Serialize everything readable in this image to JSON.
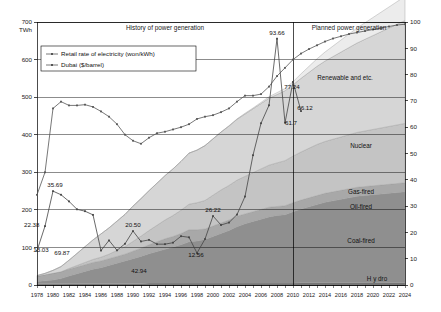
{
  "chart_data": {
    "type": "area",
    "title": "",
    "xlabel": "",
    "ylabel": "TWh",
    "y_unit_left": "TWh",
    "ylim": [
      0,
      700
    ],
    "ylim_right": [
      0,
      100
    ],
    "grid": true,
    "legend_position": "top-left",
    "x": [
      1978,
      1979,
      1980,
      1981,
      1982,
      1983,
      1984,
      1985,
      1986,
      1987,
      1988,
      1989,
      1990,
      1991,
      1992,
      1993,
      1994,
      1995,
      1996,
      1997,
      1998,
      1999,
      2000,
      2001,
      2002,
      2003,
      2004,
      2005,
      2006,
      2007,
      2008,
      2009,
      2010,
      2011,
      2012,
      2013,
      2014,
      2015,
      2016,
      2017,
      2018,
      2019,
      2020,
      2021,
      2022,
      2023,
      2024
    ],
    "x_tick_labels": [
      "1978",
      "1980",
      "1982",
      "1984",
      "1986",
      "1988",
      "1990",
      "1992",
      "1994",
      "1996",
      "1998",
      "2000",
      "2002",
      "2004",
      "2006",
      "2008",
      "2010",
      "2012",
      "2014",
      "2016",
      "2018",
      "2020",
      "2022",
      "2024"
    ],
    "y_tick_labels": [
      "0",
      "100",
      "200",
      "300",
      "400",
      "500",
      "600",
      "700"
    ],
    "y_tick_labels_right": [
      "0",
      "10",
      "20",
      "30",
      "40",
      "50",
      "60",
      "70",
      "80",
      "90",
      "100"
    ],
    "section_labels": [
      {
        "text": "History of power generation",
        "x": 1994
      },
      {
        "text": "Planned power generation",
        "x": 2017
      }
    ],
    "divider_year": 2010,
    "stacked_series": [
      {
        "name": "Hydro",
        "label": "H y dro",
        "color": "#6e6e6e",
        "values": [
          3,
          3,
          3,
          3,
          4,
          4,
          4,
          4,
          4,
          4,
          4,
          4,
          4,
          4,
          5,
          5,
          5,
          5,
          5,
          5,
          5,
          5,
          5,
          5,
          5,
          5,
          5,
          5,
          5,
          5,
          5,
          5,
          5,
          6,
          6,
          6,
          6,
          6,
          6,
          6,
          6,
          6,
          6,
          6,
          6,
          6,
          6
        ]
      },
      {
        "name": "Coal-fired",
        "label": "Coal-fired",
        "color": "#8f8f8f",
        "values": [
          6,
          8,
          10,
          14,
          20,
          26,
          32,
          38,
          42,
          48,
          54,
          60,
          66,
          72,
          78,
          84,
          90,
          96,
          102,
          110,
          112,
          116,
          124,
          132,
          140,
          150,
          158,
          164,
          170,
          176,
          180,
          182,
          190,
          196,
          202,
          208,
          214,
          218,
          222,
          226,
          230,
          232,
          234,
          236,
          238,
          240,
          242
        ]
      },
      {
        "name": "Oil-fired",
        "label": "Oil-fired",
        "color": "#a8a8a8",
        "values": [
          14,
          16,
          18,
          18,
          18,
          18,
          18,
          18,
          18,
          18,
          18,
          18,
          20,
          22,
          24,
          26,
          28,
          28,
          30,
          32,
          30,
          28,
          28,
          28,
          28,
          28,
          26,
          26,
          26,
          26,
          24,
          24,
          24,
          24,
          24,
          24,
          24,
          24,
          24,
          24,
          24,
          24,
          24,
          24,
          24,
          24,
          24
        ]
      },
      {
        "name": "Gas-fired",
        "label": "Gas-fired",
        "color": "#c4c4c4",
        "values": [
          0,
          0,
          0,
          0,
          2,
          4,
          6,
          8,
          10,
          12,
          16,
          20,
          26,
          32,
          38,
          44,
          50,
          56,
          62,
          68,
          72,
          76,
          82,
          88,
          92,
          96,
          100,
          104,
          108,
          112,
          116,
          120,
          124,
          128,
          132,
          136,
          138,
          140,
          142,
          144,
          146,
          148,
          150,
          152,
          154,
          156,
          158
        ]
      },
      {
        "name": "Nuclear",
        "label": "Nuclear",
        "color": "#d6d6d6",
        "values": [
          2,
          4,
          8,
          14,
          22,
          32,
          42,
          52,
          62,
          70,
          78,
          86,
          94,
          100,
          106,
          112,
          118,
          124,
          130,
          136,
          140,
          146,
          150,
          154,
          158,
          162,
          166,
          170,
          174,
          178,
          182,
          186,
          190,
          196,
          202,
          208,
          214,
          220,
          226,
          232,
          238,
          244,
          250,
          256,
          262,
          268,
          274
        ]
      },
      {
        "name": "Renewable and etc.",
        "label": "Renewable and etc.",
        "color": "#ececec",
        "values": [
          0,
          0,
          0,
          0,
          0,
          0,
          0,
          0,
          0,
          0,
          0,
          0,
          0,
          0,
          0,
          0,
          0,
          0,
          0,
          0,
          0,
          0,
          0,
          0,
          1,
          1,
          2,
          2,
          3,
          4,
          5,
          6,
          8,
          12,
          16,
          20,
          24,
          28,
          32,
          36,
          40,
          44,
          48,
          52,
          56,
          60,
          64
        ]
      }
    ],
    "line_series": [
      {
        "name": "Retail rate of electricity (won/kWh)",
        "axis": "left",
        "color": "#555555",
        "values": [
          240,
          300,
          470,
          488,
          478,
          478,
          480,
          474,
          462,
          448,
          428,
          400,
          384,
          376,
          392,
          404,
          408,
          414,
          420,
          428,
          442,
          448,
          452,
          460,
          470,
          488,
          504,
          504,
          508,
          528,
          556,
          578,
          600,
          616,
          628,
          638,
          648,
          656,
          662,
          668,
          672,
          676,
          680,
          684,
          688,
          692,
          694
        ]
      },
      {
        "name": "Dubai ($/barrel)",
        "axis": "right",
        "color": "#444444",
        "values": [
          13.03,
          22.38,
          35.69,
          34.32,
          31.8,
          28.78,
          28.06,
          26.67,
          13.1,
          16.95,
          13.18,
          15.68,
          20.5,
          16.56,
          17.16,
          15.52,
          15.53,
          16.1,
          18.56,
          18.13,
          12.16,
          17.47,
          26.22,
          22.81,
          23.74,
          26.78,
          33.64,
          49.35,
          61.5,
          68.34,
          93.66,
          61.7,
          77.24,
          66.12,
          null,
          null,
          null,
          null,
          null,
          null,
          null,
          null,
          null,
          null,
          null,
          null,
          null
        ]
      }
    ],
    "data_labels": [
      {
        "text": "22.38",
        "series": "Dubai ($/barrel)",
        "year": 1979,
        "value": 22.38
      },
      {
        "text": "13.03",
        "series": "Dubai ($/barrel)",
        "year": 1978,
        "value": 13.03
      },
      {
        "text": "35.69",
        "series": "Dubai ($/barrel)",
        "year": 1980,
        "value": 35.69
      },
      {
        "text": "20.50",
        "series": "Dubai ($/barrel)",
        "year": 1990,
        "value": 20.5
      },
      {
        "text": "12.56",
        "series": "Dubai ($/barrel)",
        "year": 1998,
        "value": 12.56
      },
      {
        "text": "26.22",
        "series": "Dubai ($/barrel)",
        "year": 2000,
        "value": 26.22
      },
      {
        "text": "93.66",
        "series": "Dubai ($/barrel)",
        "year": 2008,
        "value": 93.66
      },
      {
        "text": "61.7",
        "series": "Dubai ($/barrel)",
        "year": 2009,
        "value": 61.7
      },
      {
        "text": "77.24",
        "series": "Dubai ($/barrel)",
        "year": 2010,
        "value": 77.24
      },
      {
        "text": "66.12",
        "series": "Dubai ($/barrel)",
        "year": 2011,
        "value": 66.12
      },
      {
        "text": "69.87",
        "series": "Retail rate of electricity (won/kWh)",
        "year": 1981,
        "value": 69.87
      },
      {
        "text": "42.94",
        "series": "Retail rate of electricity (won/kWh)",
        "year": 1991,
        "value": 42.94
      }
    ],
    "legend": [
      {
        "label": "Retail rate of electricity (won/kWh)",
        "marker": "line-marker"
      },
      {
        "label": "Dubai ($/barrel)",
        "marker": "line-marker"
      }
    ]
  }
}
